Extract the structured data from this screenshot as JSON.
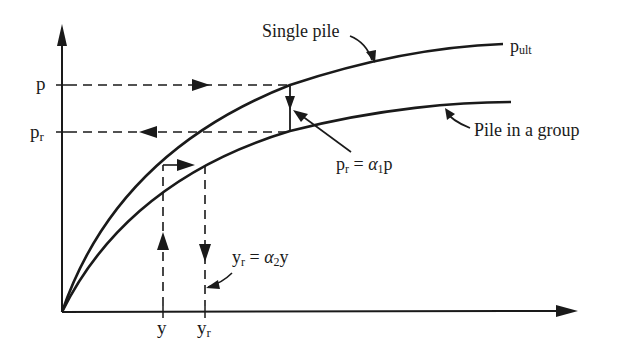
{
  "diagram": {
    "title": "",
    "curves": {
      "single": {
        "label": "Single pile",
        "end_label_main": "p",
        "end_label_sub": "ult"
      },
      "group": {
        "label": "Pile in a group"
      }
    },
    "axis_labels": {
      "p": "p",
      "pr_main": "p",
      "pr_sub": "r",
      "y": "y",
      "yr_main": "y",
      "yr_sub": "r"
    },
    "equations": {
      "p_reduction": {
        "lhs_main": "p",
        "lhs_sub": "r",
        "eq": " = ",
        "alpha": "α",
        "alpha_sub": "1",
        "rhs": "p"
      },
      "y_increase": {
        "lhs_main": "y",
        "lhs_sub": "r",
        "eq": " = ",
        "alpha": "α",
        "alpha_sub": "2",
        "rhs": "y"
      }
    },
    "colors": {
      "ink": "#1a1a1a",
      "background": "#ffffff"
    }
  }
}
